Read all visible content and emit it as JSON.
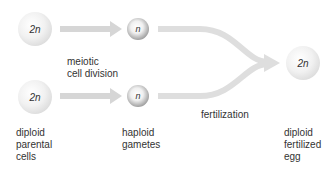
{
  "cells": {
    "top_parent": {
      "label": "2n"
    },
    "bottom_parent": {
      "label": "2n"
    },
    "top_gamete": {
      "label": "n"
    },
    "bottom_gamete": {
      "label": "n"
    },
    "zygote": {
      "label": "2n"
    }
  },
  "labels": {
    "meiosis_line1": "meiotic",
    "meiosis_line2": "cell division",
    "parent_line1": "diploid",
    "parent_line2": "parental",
    "parent_line3": "cells",
    "gamete_line1": "haploid",
    "gamete_line2": "gametes",
    "fertilization": "fertilization",
    "egg_line1": "diploid",
    "egg_line2": "fertilized",
    "egg_line3": "egg"
  },
  "colors": {
    "arrow": "#d9d9d9",
    "text": "#333333"
  }
}
